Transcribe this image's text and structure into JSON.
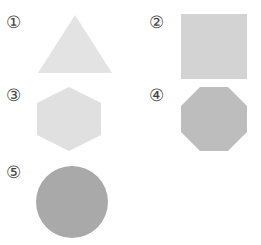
{
  "figure": {
    "shapes": [
      {
        "number": "①",
        "name": "triangle",
        "color": "#e3e3e3"
      },
      {
        "number": "②",
        "name": "square",
        "color": "#d3d3d3"
      },
      {
        "number": "③",
        "name": "hexagon",
        "color": "#e0e0e0"
      },
      {
        "number": "④",
        "name": "octagon",
        "color": "#bdbdbd"
      },
      {
        "number": "⑤",
        "name": "circle",
        "color": "#a9a9a9"
      }
    ]
  }
}
